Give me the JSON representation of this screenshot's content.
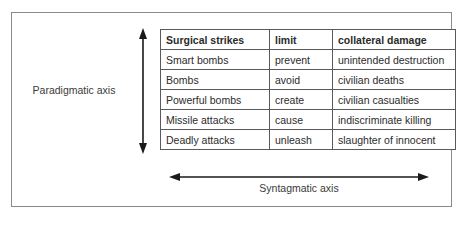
{
  "diagram": {
    "axes": {
      "vertical": {
        "label": "Paradigmatic axis",
        "icon": "double-headed-vertical-arrow-icon"
      },
      "horizontal": {
        "label": "Syntagmatic axis",
        "icon": "double-headed-horizontal-arrow-icon"
      }
    },
    "colors": {
      "frame_border": "#8a8a8a",
      "table_border": "#5a5a5a",
      "text": "#2b2b2b",
      "axis_line": "#1a1a1a",
      "background": "#ffffff"
    }
  },
  "table": {
    "headers": [
      "Surgical strikes",
      "limit",
      "collateral damage"
    ],
    "rows": [
      [
        "Smart bombs",
        "prevent",
        "unintended destruction"
      ],
      [
        "Bombs",
        "avoid",
        "civilian deaths"
      ],
      [
        "Powerful bombs",
        "create",
        "civilian casualties"
      ],
      [
        "Missile attacks",
        "cause",
        "indiscriminate killing"
      ],
      [
        "Deadly attacks",
        "unleash",
        "slaughter of innocent"
      ]
    ]
  }
}
